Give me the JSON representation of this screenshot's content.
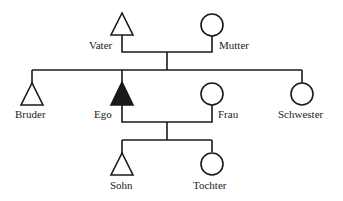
{
  "diagram": {
    "type": "genealogy",
    "colors": {
      "line": "#1a1a1a",
      "ego_fill": "#1a1a1a",
      "background": "#ffffff"
    },
    "people": [
      {
        "id": "vater",
        "label": "Vater",
        "sex": "male",
        "symbol": "triangle"
      },
      {
        "id": "mutter",
        "label": "Mutter",
        "sex": "female",
        "symbol": "circle"
      },
      {
        "id": "bruder",
        "label": "Bruder",
        "sex": "male",
        "symbol": "triangle"
      },
      {
        "id": "ego",
        "label": "Ego",
        "sex": "male",
        "symbol": "triangle-filled"
      },
      {
        "id": "frau",
        "label": "Frau",
        "sex": "female",
        "symbol": "circle"
      },
      {
        "id": "schwester",
        "label": "Schwester",
        "sex": "female",
        "symbol": "circle"
      },
      {
        "id": "sohn",
        "label": "Sohn",
        "sex": "male",
        "symbol": "triangle"
      },
      {
        "id": "tochter",
        "label": "Tochter",
        "sex": "female",
        "symbol": "circle"
      }
    ],
    "relations": [
      {
        "type": "marriage",
        "between": [
          "vater",
          "mutter"
        ]
      },
      {
        "type": "siblings",
        "members": [
          "bruder",
          "ego",
          "schwester"
        ],
        "parents": [
          "vater",
          "mutter"
        ]
      },
      {
        "type": "marriage",
        "between": [
          "ego",
          "frau"
        ]
      },
      {
        "type": "siblings",
        "members": [
          "sohn",
          "tochter"
        ],
        "parents": [
          "ego",
          "frau"
        ]
      }
    ]
  },
  "labels": {
    "vater": "Vater",
    "mutter": "Mutter",
    "bruder": "Bruder",
    "ego": "Ego",
    "frau": "Frau",
    "schwester": "Schwester",
    "sohn": "Sohn",
    "tochter": "Tochter"
  }
}
